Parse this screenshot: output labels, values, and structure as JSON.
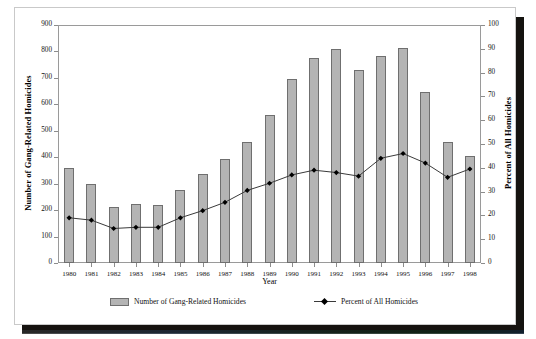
{
  "chart_data": {
    "type": "bar",
    "title": "",
    "subtitle": "",
    "xlabel": "Year",
    "ylabel": "Number of Gang-Related Homicides",
    "y2label": "Percent of All Homicides",
    "grid": false,
    "legend_position": "bottom",
    "categories": [
      "1980",
      "1981",
      "1982",
      "1983",
      "1984",
      "1985",
      "1986",
      "1987",
      "1988",
      "1989",
      "1990",
      "1991",
      "1992",
      "1993",
      "1994",
      "1995",
      "1996",
      "1997",
      "1998"
    ],
    "ylim": [
      0,
      900
    ],
    "y2lim": [
      0,
      100
    ],
    "yticks": [
      900,
      800,
      700,
      600,
      500,
      400,
      300,
      200,
      100,
      0
    ],
    "y2ticks": [
      100,
      90,
      80,
      70,
      60,
      50,
      40,
      30,
      20,
      10,
      0
    ],
    "series": [
      {
        "name": "Number of Gang-Related Homicides",
        "type": "bar",
        "axis": "left",
        "color": "#b4b4b4",
        "edge_color": "#6f6f6f",
        "values": [
          358,
          300,
          212,
          222,
          218,
          277,
          335,
          395,
          457,
          560,
          697,
          777,
          808,
          730,
          784,
          812,
          647,
          457,
          405
        ]
      },
      {
        "name": "Percent of All Homicides",
        "type": "line",
        "axis": "right",
        "color": "#3a3a3a",
        "marker": "diamond",
        "marker_color": "#000000",
        "values": [
          19,
          18,
          14.5,
          15,
          15,
          19,
          22,
          25.5,
          30.5,
          33.5,
          37,
          39,
          38,
          36.5,
          44,
          46,
          42,
          36,
          39.5
        ]
      }
    ]
  },
  "legend": {
    "bar_label": "Number of Gang-Related Homicides",
    "line_label": "Percent of All Homicides"
  }
}
